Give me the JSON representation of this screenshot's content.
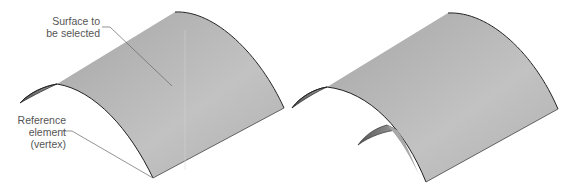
{
  "figure": {
    "left": {
      "surface_label_line1": "Surface to",
      "surface_label_line2": "be selected",
      "reference_label_line1": "Reference",
      "reference_label_line2": "element",
      "reference_label_line3": "(vertex)"
    },
    "right": {}
  },
  "colors": {
    "surface": "#b4b4b4",
    "surface_light": "#cfcfcf",
    "edge": "#2a2a2a",
    "leader": "#666666",
    "text": "#555555"
  }
}
